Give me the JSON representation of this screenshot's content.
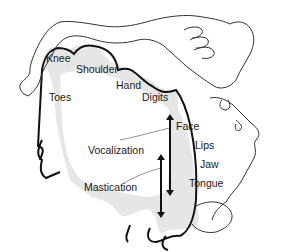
{
  "figure": {
    "labels": {
      "knee": "Knee",
      "shoulder": "Shoulder",
      "hand": "Hand",
      "digits": "Digits",
      "toes": "Toes",
      "face": "Face",
      "lips": "Lips",
      "jaw": "Jaw",
      "tongue": "Tongue",
      "vocalization": "Vocalization",
      "mastication": "Mastication"
    },
    "colors": {
      "outline": "#111111",
      "cortex_fill": "#e6e6e6",
      "body_line": "#333333",
      "background": "#ffffff"
    }
  }
}
